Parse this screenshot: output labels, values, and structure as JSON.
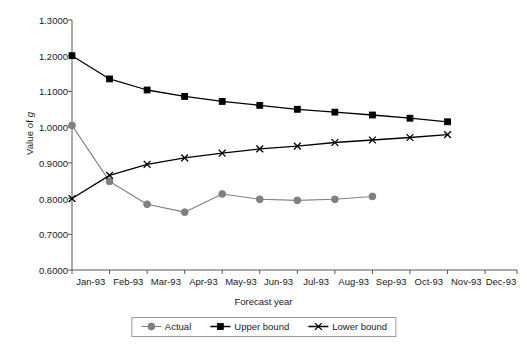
{
  "chart_data": {
    "type": "line",
    "title": "",
    "xlabel": "Forecast year",
    "ylabel": "Value of g",
    "ylabel_html": "Value of <i>g</i>",
    "categories": [
      "Jan-93",
      "Feb-93",
      "Mar-93",
      "Apr-93",
      "May-93",
      "Jun-93",
      "Jul-93",
      "Aug-93",
      "Sep-93",
      "Oct-93",
      "Nov-93",
      "Dec-93"
    ],
    "ylim": [
      0.6,
      1.3
    ],
    "ytick_labels": [
      "1.3000",
      "1.2000",
      "1.1000",
      "1.0000",
      "0.9000",
      "0.8000",
      "0.7000",
      "0.6000"
    ],
    "ytick_values": [
      1.3,
      1.2,
      1.1,
      1.0,
      0.9,
      0.8,
      0.7,
      0.6
    ],
    "grid": false,
    "legend_position": "bottom",
    "series": [
      {
        "name": "Actual",
        "marker": "circle",
        "color": "#808080",
        "values": [
          1.005,
          0.848,
          0.784,
          0.762,
          0.813,
          0.798,
          0.795,
          0.798,
          0.806,
          null,
          null,
          null
        ]
      },
      {
        "name": "Upper bound",
        "marker": "square",
        "color": "#000000",
        "values": [
          1.2,
          1.135,
          1.104,
          1.086,
          1.072,
          1.061,
          1.05,
          1.042,
          1.034,
          1.025,
          1.015,
          null
        ]
      },
      {
        "name": "Lower bound",
        "marker": "x",
        "color": "#000000",
        "values": [
          0.8,
          0.865,
          0.896,
          0.914,
          0.927,
          0.939,
          0.947,
          0.957,
          0.964,
          0.971,
          0.979,
          null
        ]
      }
    ]
  },
  "legend": {
    "items": [
      {
        "label": "Actual"
      },
      {
        "label": "Upper bound"
      },
      {
        "label": "Lower bound"
      }
    ]
  },
  "colors": {
    "actual": "#808080",
    "bounds": "#000000",
    "axis": "#595959",
    "legend_border": "#9a9a9a"
  }
}
